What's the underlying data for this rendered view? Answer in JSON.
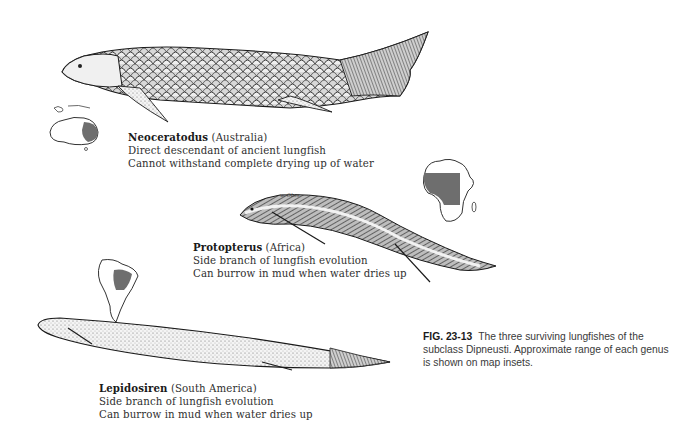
{
  "figure": {
    "number": "FIG. 23-13",
    "caption": "The three surviving lungfishes of the subclass Dipneusti. Approximate range of each genus is shown on map insets.",
    "map_fill_color": "#6e6e6e"
  },
  "species": [
    {
      "genus": "Neoceratodus",
      "region": "(Australia)",
      "lines": [
        "Direct descendant of ancient lungfish",
        "Cannot withstand complete drying up of water"
      ],
      "map": "australia-map"
    },
    {
      "genus": "Protopterus",
      "region": "(Africa)",
      "lines": [
        "Side branch of lungfish evolution",
        "Can burrow in mud when water dries up"
      ],
      "map": "africa-map"
    },
    {
      "genus": "Lepidosiren",
      "region": "(South America)",
      "lines": [
        "Side branch of lungfish evolution",
        "Can burrow in mud when water dries up"
      ],
      "map": "south-america-map"
    }
  ]
}
